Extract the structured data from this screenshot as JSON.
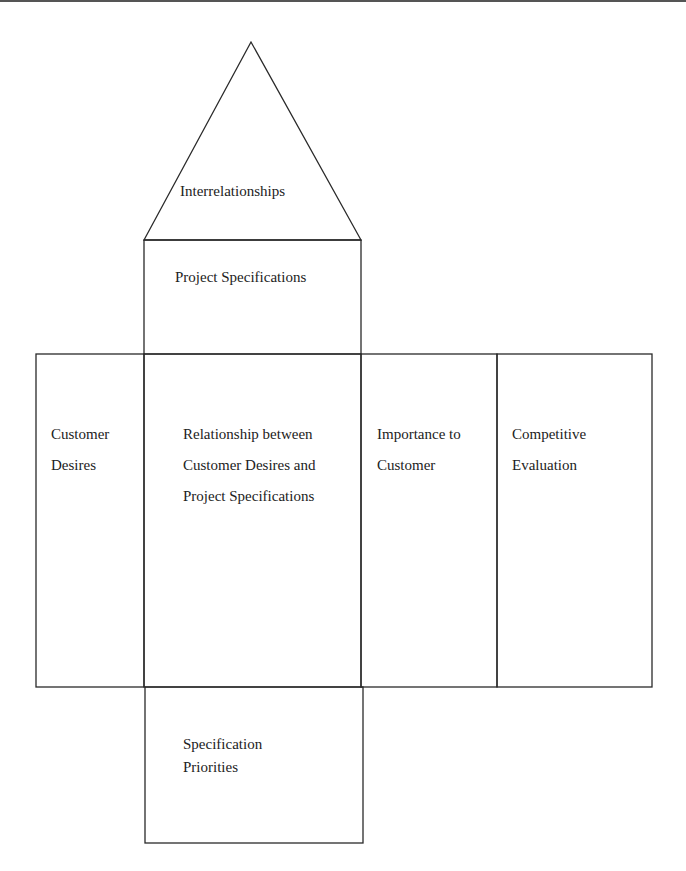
{
  "diagram": {
    "colors": {
      "stroke": "#2a2a2a",
      "text": "#222222",
      "background": "#ffffff",
      "top_rule": "#555555"
    },
    "roof": {
      "label": "Interrelationships"
    },
    "ceiling": {
      "label": "Project Specifications"
    },
    "row": {
      "customer_desires": {
        "lines": [
          "Customer",
          "Desires"
        ]
      },
      "relationship_matrix": {
        "lines": [
          "Relationship between",
          "Customer Desires and",
          "Project Specifications"
        ]
      },
      "importance": {
        "lines": [
          "Importance to",
          "Customer"
        ]
      },
      "competitive_evaluation": {
        "lines": [
          "Competitive",
          "Evaluation"
        ]
      }
    },
    "basement": {
      "lines": [
        "Specification",
        "Priorities"
      ]
    }
  }
}
